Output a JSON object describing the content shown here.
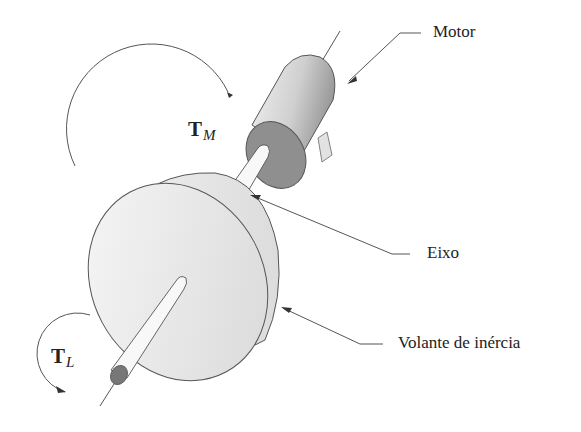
{
  "diagram": {
    "type": "mechanical-schematic",
    "labels": {
      "motor": "Motor",
      "shaft": "Eixo",
      "flywheel": "Volante de inércia"
    },
    "torques": {
      "motor": {
        "symbol": "T",
        "subscript": "M"
      },
      "load": {
        "symbol": "T",
        "subscript": "L"
      }
    },
    "colors": {
      "stroke": "#555555",
      "motor_body": "#d9d9d9",
      "motor_face": "#8c8c8c",
      "shaft": "#f7f7f7",
      "flywheel": "#ebebeb",
      "shaft_end": "#777777",
      "text": "#222222"
    }
  }
}
